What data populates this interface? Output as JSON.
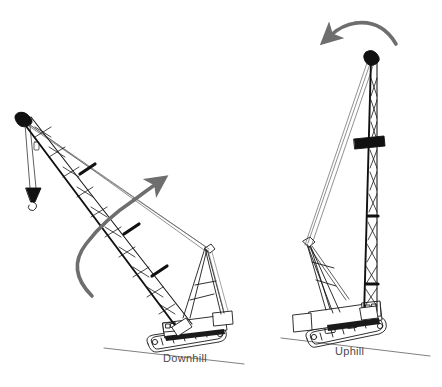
{
  "figure": {
    "background_color": "#ffffff",
    "line_color": "#1a1a1a",
    "arrow_color": "#6e6e6e",
    "label_color": "#4a4a4a"
  },
  "scenes": [
    {
      "id": "downhill",
      "label": "Downhill",
      "boom_orientation": "boom lowered toward the downhill side, approx 45 degrees",
      "arrow": {
        "name": "swing-arrow-downhill",
        "direction": "counterclockwise sweep from lower-left up to upper-right",
        "head_position": "upper-right"
      },
      "has_load_line": true,
      "has_hook_block": true
    },
    {
      "id": "uphill",
      "label": "Uphill",
      "boom_orientation": "boom raised nearly vertical over the uphill side",
      "arrow": {
        "name": "swing-arrow-uphill",
        "direction": "clockwise sweep from right over the top to the left",
        "head_position": "upper-left"
      },
      "has_load_line": false,
      "has_hook_block": false
    }
  ],
  "ground": {
    "name": "slope-line",
    "description": "ground line sloping down to the right"
  }
}
